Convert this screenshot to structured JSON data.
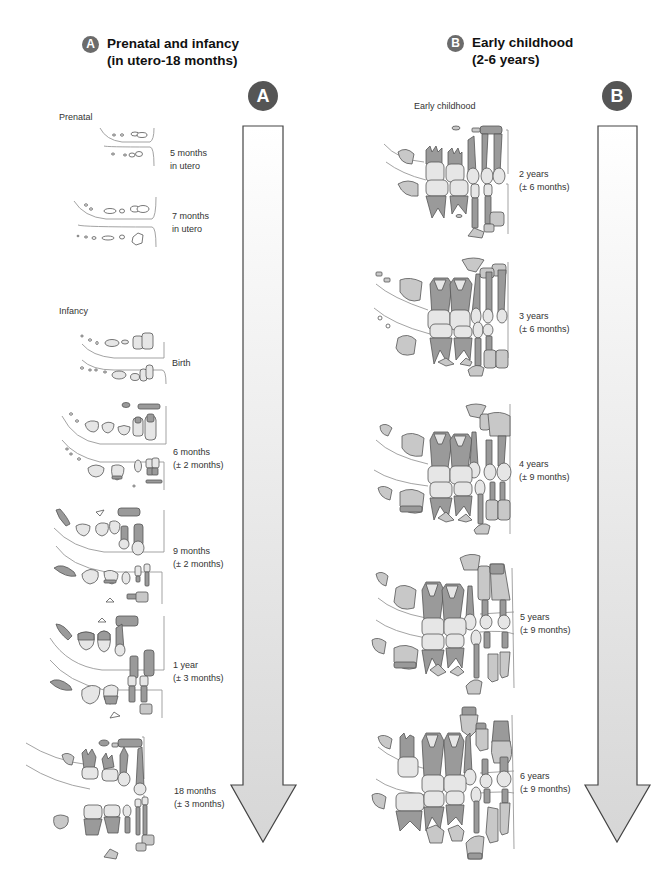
{
  "sections": [
    {
      "id": "A",
      "badge": "A",
      "title_line1": "Prenatal and infancy",
      "title_line2": "(in utero-18 months)",
      "arrow_badge": "A",
      "groups": [
        {
          "label": "Prenatal"
        },
        {
          "label": "Infancy"
        }
      ],
      "stages": [
        {
          "line1": "5 months",
          "line2": "in utero"
        },
        {
          "line1": "7 months",
          "line2": "in utero"
        },
        {
          "line1": "Birth",
          "line2": ""
        },
        {
          "line1": "6 months",
          "line2": "(± 2 months)"
        },
        {
          "line1": "9 months",
          "line2": "(± 2 months)"
        },
        {
          "line1": "1 year",
          "line2": "(± 3 months)"
        },
        {
          "line1": "18 months",
          "line2": "(± 3 months)"
        }
      ]
    },
    {
      "id": "B",
      "badge": "B",
      "title_line1": "Early childhood",
      "title_line2": "(2-6 years)",
      "arrow_badge": "B",
      "groups": [
        {
          "label": "Early childhood"
        }
      ],
      "stages": [
        {
          "line1": "2 years",
          "line2": "(± 6 months)"
        },
        {
          "line1": "3 years",
          "line2": "(± 6 months)"
        },
        {
          "line1": "4 years",
          "line2": "(± 9 months)"
        },
        {
          "line1": "5 years",
          "line2": "(± 9 months)"
        },
        {
          "line1": "6 years",
          "line2": "(± 9 months)"
        }
      ]
    }
  ],
  "icons": {
    "arrow": "down-arrow-icon",
    "teeth": "dentition-illustration"
  },
  "colors": {
    "badge": "#666666",
    "arrow_fill": "#e0e0e0",
    "arrow_stroke": "#444444",
    "tooth_dark": "#9a9a9a",
    "tooth_light": "#e6e6e6"
  }
}
